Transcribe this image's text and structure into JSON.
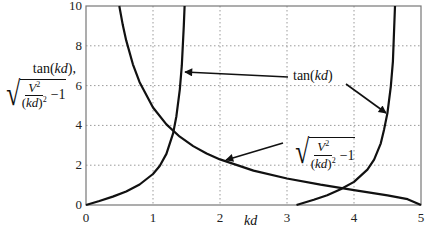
{
  "chart_data": {
    "type": "line",
    "title": "",
    "xlabel": "kd",
    "ylabel": "tan(kd), sqrt(V^2/(kd)^2 - 1)",
    "ylabel_parts": {
      "line1_prefix": "tan(",
      "line1_var": "kd",
      "line1_suffix": "),",
      "num": "V",
      "den_var": "kd",
      "minus_one": "−1"
    },
    "xlim": [
      0,
      5
    ],
    "ylim": [
      0,
      10
    ],
    "xticks": [
      0,
      1,
      2,
      3,
      4,
      5
    ],
    "yticks": [
      0,
      2,
      4,
      6,
      8,
      10
    ],
    "grid": true,
    "grid_style": "dotted",
    "legend": "none (inline annotations with arrows)",
    "parameters": {
      "V": 5
    },
    "series": [
      {
        "name": "tan(kd) branch 1",
        "x": [
          0,
          0.2,
          0.4,
          0.6,
          0.8,
          1.0,
          1.1,
          1.2,
          1.3,
          1.35,
          1.4,
          1.43,
          1.46,
          1.471
        ],
        "y": [
          0,
          0.2,
          0.42,
          0.68,
          1.03,
          1.56,
          1.96,
          2.57,
          3.6,
          4.46,
          5.8,
          7.0,
          9.0,
          10
        ]
      },
      {
        "name": "tan(kd) branch 2",
        "x": [
          3.1416,
          3.4,
          3.6,
          3.8,
          4.0,
          4.2,
          4.3,
          4.4,
          4.45,
          4.5,
          4.55,
          4.58,
          4.612
        ],
        "y": [
          0,
          0.26,
          0.49,
          0.79,
          1.16,
          1.78,
          2.28,
          3.1,
          3.8,
          4.64,
          5.95,
          7.2,
          10
        ]
      },
      {
        "name": "sqrt(V^2/(kd)^2 - 1)",
        "x": [
          0.497,
          0.55,
          0.6,
          0.7,
          0.8,
          1.0,
          1.2,
          1.4,
          1.6,
          1.8,
          2.0,
          2.5,
          3.0,
          3.5,
          4.0,
          4.5,
          4.8,
          5.0
        ],
        "y": [
          10,
          9.04,
          8.27,
          7.07,
          6.17,
          4.9,
          4.05,
          3.43,
          2.96,
          2.59,
          2.29,
          1.73,
          1.33,
          1.02,
          0.75,
          0.48,
          0.29,
          0
        ]
      }
    ],
    "annotations": [
      {
        "text_prefix": "tan(",
        "text_var": "kd",
        "text_suffix": ")",
        "x": 3.1,
        "y": 6.5,
        "arrows_to": [
          [
            1.47,
            6.75
          ],
          [
            4.48,
            4.6
          ]
        ]
      },
      {
        "text": "sqrt(V^2/(kd)^2 - 1)",
        "x": 3.15,
        "y": 2.8,
        "arrow_to": [
          2.03,
          2.3
        ]
      }
    ]
  },
  "tick_labels": {
    "x": [
      "0",
      "1",
      "2",
      "3",
      "4",
      "5"
    ],
    "y": [
      "0",
      "2",
      "4",
      "6",
      "8",
      "10"
    ]
  },
  "annotation_text": {
    "tan_prefix": "tan(",
    "tan_var": "kd",
    "tan_suffix": ")",
    "num": "V",
    "den_var": "kd",
    "minus_one": "−1"
  },
  "colors": {
    "curve": "#111111",
    "grid": "#9a9a9a",
    "axis": "#777777"
  }
}
